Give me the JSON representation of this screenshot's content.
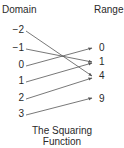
{
  "diagram": {
    "headers": {
      "domain": "Domain",
      "range": "Range"
    },
    "domain": [
      "−2",
      "−1",
      "0",
      "1",
      "2",
      "3"
    ],
    "range": [
      "0",
      "1",
      "4",
      "9"
    ],
    "mappings": [
      {
        "from": "−2",
        "to": "4"
      },
      {
        "from": "−1",
        "to": "1"
      },
      {
        "from": "0",
        "to": "0"
      },
      {
        "from": "1",
        "to": "1"
      },
      {
        "from": "2",
        "to": "4"
      },
      {
        "from": "3",
        "to": "9"
      }
    ],
    "caption_line1": "The Squaring",
    "caption_line2": "Function",
    "line_color": "#555555"
  }
}
